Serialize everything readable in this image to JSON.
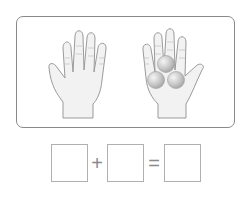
{
  "illustration": {
    "frame_color": "#8a8a8a",
    "left_hand": {
      "label": "open hand",
      "balls": 0
    },
    "right_hand": {
      "label": "hand holding balls",
      "balls": 3
    },
    "skin_fill": "#f2f2f2",
    "outline": "#9a9a9a"
  },
  "equation": {
    "operand_1": "",
    "plus_symbol": "+",
    "operand_2": "",
    "equals_symbol": "=",
    "result": ""
  }
}
